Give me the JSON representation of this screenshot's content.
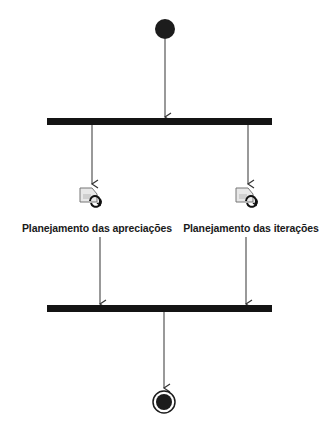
{
  "diagram": {
    "type": "uml-activity",
    "colors": {
      "node_fill": "#1c1c1c",
      "bar_fill": "#141414",
      "edge": "#444444",
      "label": "#1a1a1a",
      "background": "#ffffff"
    },
    "nodes": {
      "initial": {
        "kind": "initial-node"
      },
      "fork": {
        "kind": "fork-bar"
      },
      "join": {
        "kind": "join-bar"
      },
      "final": {
        "kind": "final-node"
      },
      "actions": [
        {
          "id": "left",
          "icon": "subactivity-call-icon",
          "label": "Planejamento das apreciações"
        },
        {
          "id": "right",
          "icon": "subactivity-call-icon",
          "label": "Planejamento das iterações"
        }
      ]
    },
    "edges": [
      {
        "from": "initial",
        "to": "fork"
      },
      {
        "from": "fork",
        "to": "left"
      },
      {
        "from": "fork",
        "to": "right"
      },
      {
        "from": "left",
        "to": "join"
      },
      {
        "from": "right",
        "to": "join"
      },
      {
        "from": "join",
        "to": "final"
      }
    ]
  }
}
